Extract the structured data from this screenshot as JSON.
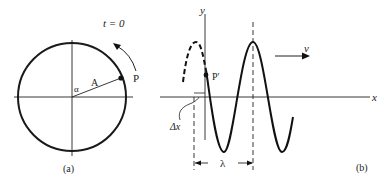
{
  "panel_a": {
    "caption": "(a)",
    "time_label": "t = 0",
    "radius_label": "A",
    "angle_label": "α",
    "point_label": "P"
  },
  "panel_b": {
    "caption": "(b)",
    "y_axis_label": "y",
    "x_axis_label": "x",
    "velocity_label": "v",
    "point_label": "P′",
    "offset_label": "Δx",
    "wavelength_label": "λ"
  },
  "colors": {
    "ink": "#1a1a1a",
    "background": "#ffffff"
  }
}
